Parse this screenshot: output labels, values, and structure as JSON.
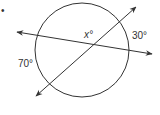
{
  "diagram": {
    "type": "geometry-circle-secants",
    "bullet": "•",
    "labels": {
      "unknown_angle": "x°",
      "arc_right": "30°",
      "arc_left": "70°"
    },
    "colors": {
      "stroke": "#333333",
      "text": "#333333",
      "background": "#ffffff"
    }
  }
}
